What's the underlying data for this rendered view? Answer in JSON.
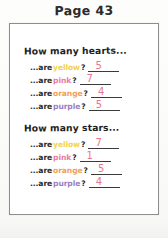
{
  "header": {
    "page_label": "Page 43"
  },
  "colors": {
    "yellow": "#f2d24b",
    "pink": "#e87ba4",
    "orange": "#f0a05a",
    "purple": "#9b7fc4",
    "answer_ink": "#e8758f",
    "text_ink": "#2a2a2a",
    "box_border": "#8e8e8e"
  },
  "worksheet": {
    "blocks": [
      {
        "heading": "How many hearts...",
        "rows": [
          {
            "prefix": "...are",
            "color_word": "yellow",
            "color": "#f2d24b",
            "question_mark": "?",
            "answer": "5"
          },
          {
            "prefix": "...are",
            "color_word": "pink",
            "color": "#e87ba4",
            "question_mark": "?",
            "answer": "7"
          },
          {
            "prefix": "...are",
            "color_word": "orange",
            "color": "#f0a05a",
            "question_mark": "?",
            "answer": "4"
          },
          {
            "prefix": "...are",
            "color_word": "purple",
            "color": "#9b7fc4",
            "question_mark": "?",
            "answer": "5"
          }
        ]
      },
      {
        "heading": "How many stars...",
        "rows": [
          {
            "prefix": "...are",
            "color_word": "yellow",
            "color": "#f2d24b",
            "question_mark": "?",
            "answer": "7"
          },
          {
            "prefix": "...are",
            "color_word": "pink",
            "color": "#e87ba4",
            "question_mark": "?",
            "answer": "1"
          },
          {
            "prefix": "...are",
            "color_word": "orange",
            "color": "#f0a05a",
            "question_mark": "?",
            "answer": "5"
          },
          {
            "prefix": "...are",
            "color_word": "purple",
            "color": "#9b7fc4",
            "question_mark": "?",
            "answer": "4"
          }
        ]
      }
    ]
  }
}
